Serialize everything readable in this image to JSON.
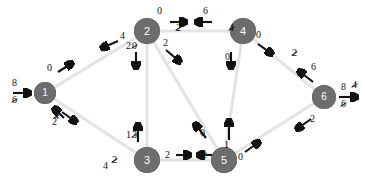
{
  "diagram": {
    "colors": {
      "node_fill": "#6d6d6d",
      "node_text": "#ffffff",
      "edge": "#e3e3e3",
      "label_text": "#111111",
      "background": "#ffffff"
    },
    "nodes": [
      {
        "id": "1",
        "label": "1",
        "x": 45,
        "y": 93
      },
      {
        "id": "2",
        "label": "2",
        "x": 147,
        "y": 31
      },
      {
        "id": "3",
        "label": "3",
        "x": 147,
        "y": 160
      },
      {
        "id": "4",
        "label": "4",
        "x": 243,
        "y": 31
      },
      {
        "id": "5",
        "label": "5",
        "x": 224,
        "y": 160
      },
      {
        "id": "6",
        "label": "6",
        "x": 324,
        "y": 97
      }
    ],
    "edges": [
      {
        "from": "1",
        "to": "2"
      },
      {
        "from": "1",
        "to": "3"
      },
      {
        "from": "2",
        "to": "4"
      },
      {
        "from": "2",
        "to": "3"
      },
      {
        "from": "2",
        "to": "5"
      },
      {
        "from": "3",
        "to": "5"
      },
      {
        "from": "4",
        "to": "5"
      },
      {
        "from": "4",
        "to": "6"
      },
      {
        "from": "5",
        "to": "6"
      }
    ],
    "terminals": {
      "source": {
        "current": "8",
        "previous": "6",
        "previous_struck": true
      },
      "sink": {
        "current": "8",
        "previous": "6",
        "previous_struck": true
      }
    },
    "labels": {
      "n1_to_n2": "0",
      "n2_to_n1": "4",
      "n1_to_n3_struck": "4",
      "n1_to_n3": "2",
      "n3_to_n1_struck": "2",
      "n3_to_n1_below": "4",
      "n2_to_n4": "0",
      "n2_to_n4_struck": "2",
      "n4_to_n2": "6",
      "n4_to_n2_struck": "4",
      "n2_to_n3": "2",
      "n2_to_n3_struck": "0",
      "n3_to_n2": "1",
      "n3_to_n2_struck": "3",
      "n2_to_n5": "2",
      "n5_to_n2": "0",
      "n4_to_n5": "0",
      "n5_to_n4": "1",
      "n4_to_n6": "0",
      "n4_to_n6_struck": "2",
      "n6_to_n4": "6",
      "n6_to_n4_struck": "4",
      "n3_to_n5": "2",
      "n5_to_n3": "2",
      "n5_to_n6": "0",
      "n6_to_n5": "2"
    }
  }
}
